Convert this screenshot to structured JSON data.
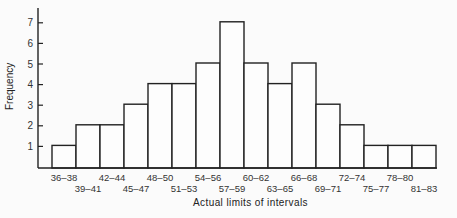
{
  "chart_data": {
    "type": "bar",
    "title": "",
    "xlabel": "Actual limits of intervals",
    "ylabel": "Frequency",
    "ylim": [
      0,
      7.5
    ],
    "yticks": [
      1,
      2,
      3,
      4,
      5,
      6,
      7
    ],
    "grid": false,
    "legend": null,
    "categories": [
      "36–38",
      "39–41",
      "42–44",
      "45–47",
      "48–50",
      "51–53",
      "54–56",
      "57–59",
      "60–62",
      "63–65",
      "66–68",
      "69–71",
      "72–74",
      "75–77",
      "78–80",
      "81–83"
    ],
    "values": [
      1,
      2,
      2,
      3,
      4,
      4,
      5,
      7,
      5,
      4,
      5,
      3,
      2,
      1,
      1,
      1
    ]
  },
  "labels": {
    "xlabel": "Actual limits of intervals",
    "ylabel": "Frequency"
  }
}
